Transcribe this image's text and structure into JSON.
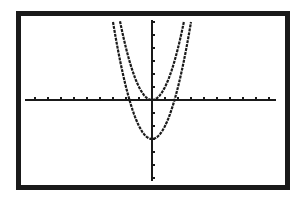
{
  "chart_data": {
    "type": "line",
    "title": "",
    "xlabel": "",
    "ylabel": "",
    "xlim": [
      -10,
      10
    ],
    "ylim": [
      -6.2,
      6.2
    ],
    "grid": false,
    "axes_ticks": {
      "x_tick_step": 1,
      "y_tick_step": 1
    },
    "series": [
      {
        "name": "Y1",
        "equation": "y = x^2",
        "vertex": [
          0,
          0
        ],
        "x_intercepts": [
          0
        ]
      },
      {
        "name": "Y2",
        "equation": "y = x^2 - 3",
        "vertex": [
          0,
          -3
        ],
        "x_intercepts": [
          -1.73,
          1.73
        ]
      }
    ],
    "colors": {
      "frame": "#1a1a1a",
      "ink": "#1a1a1a",
      "background": "#ffffff"
    }
  },
  "screen": {
    "origin_px": [
      152,
      100
    ],
    "unit_px": 13
  }
}
